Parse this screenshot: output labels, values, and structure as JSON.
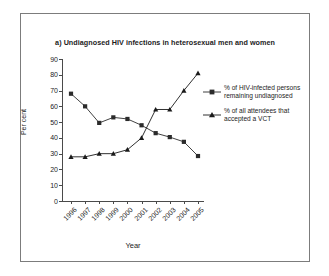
{
  "figure": {
    "title": "a) Undiagnosed HIV infections in heterosexual men and women",
    "frame_color": "#7c7c7c",
    "background": "#ffffff"
  },
  "chart_data": {
    "type": "line",
    "title": "a) Undiagnosed HIV infections in heterosexual men and women",
    "xlabel": "Year",
    "ylabel": "Per cent",
    "categories": [
      "1996",
      "1997",
      "1998",
      "1999",
      "2000",
      "2001",
      "2002",
      "2003",
      "2004",
      "2005"
    ],
    "ylim": [
      0,
      90
    ],
    "yticks": [
      0,
      10,
      20,
      30,
      40,
      50,
      60,
      70,
      80,
      90
    ],
    "grid": false,
    "legend_position": "right",
    "series": [
      {
        "name": "% of HIV-infected persons remaining undiagnosed",
        "marker": "square",
        "color": "#2b2b2b",
        "values": [
          68,
          60,
          49.5,
          53,
          52,
          48,
          43,
          40.5,
          37.5,
          28.5
        ]
      },
      {
        "name": "% of all attendees that accepted a VCT",
        "marker": "triangle",
        "color": "#1a1a1a",
        "values": [
          28,
          28,
          30,
          30,
          32.5,
          40,
          58,
          58,
          70,
          81
        ]
      }
    ]
  },
  "legend": {
    "items": [
      {
        "label": "% of HIV-infected persons remaining undiagnosed",
        "marker": "square"
      },
      {
        "label": "% of all attendees that accepted a VCT",
        "marker": "triangle"
      }
    ]
  }
}
